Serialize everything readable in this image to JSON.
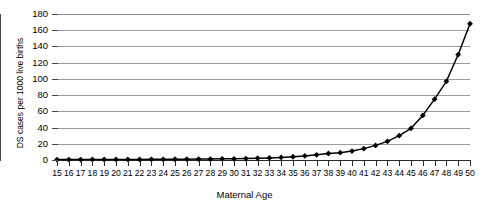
{
  "chart_data": {
    "type": "line",
    "title": "",
    "xlabel": "Maternal Age",
    "ylabel": "DS cases per 1000 live births",
    "xlim": [
      15,
      50
    ],
    "ylim": [
      0,
      180
    ],
    "ytick_labels": [
      "180",
      "160",
      "140",
      "120",
      "100",
      "80",
      "60",
      "40",
      "20",
      "0"
    ],
    "ytick_values": [
      180,
      160,
      140,
      120,
      100,
      80,
      60,
      40,
      20,
      0
    ],
    "grid": "horizontal",
    "legend": "none",
    "marker": "diamond",
    "line_color": "#000000",
    "grid_color": "#9a9a9a",
    "categories": [
      15,
      16,
      17,
      18,
      19,
      20,
      21,
      22,
      23,
      24,
      25,
      26,
      27,
      28,
      29,
      30,
      31,
      32,
      33,
      34,
      35,
      36,
      37,
      38,
      39,
      40,
      41,
      42,
      43,
      44,
      45,
      46,
      47,
      48,
      49,
      50
    ],
    "xtick_labels": [
      "15",
      "16",
      "17",
      "18",
      "19",
      "20",
      "21",
      "22",
      "23",
      "24",
      "25",
      "26",
      "27",
      "28",
      "29",
      "30",
      "31",
      "32",
      "33",
      "34",
      "35",
      "36",
      "37",
      "38",
      "39",
      "40",
      "41",
      "42",
      "43",
      "44",
      "45",
      "46",
      "47",
      "48",
      "49",
      "50"
    ],
    "series": [
      {
        "name": "DS cases per 1000 live births",
        "values": [
          0.5,
          0.5,
          0.5,
          0.6,
          0.6,
          0.7,
          0.7,
          0.7,
          0.8,
          0.8,
          0.9,
          1.0,
          1.1,
          1.2,
          1.4,
          1.5,
          1.8,
          2.2,
          2.6,
          3.2,
          4.0,
          5.0,
          6.4,
          8.0,
          9.0,
          11.0,
          14.0,
          18.0,
          23.0,
          30.0,
          39.0,
          55.0,
          75.0,
          97.0,
          130.0,
          168.0
        ]
      }
    ]
  }
}
